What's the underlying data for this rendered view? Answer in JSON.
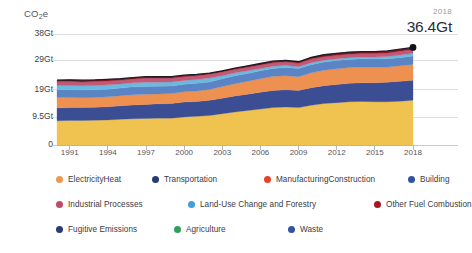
{
  "axis_unit_prefix": "CO",
  "axis_unit_sub": "2",
  "axis_unit_suffix": "e",
  "callout": {
    "year": "2018",
    "value": "36.4Gt"
  },
  "legend": {
    "rows": [
      [
        {
          "label": "ElectricityHeat",
          "color": "#eb9a52"
        },
        {
          "label": "Transportation",
          "color": "#2a3b74"
        },
        {
          "label": "ManufacturingConstruction",
          "color": "#e8402a"
        },
        {
          "label": "Building",
          "color": "#33539e"
        }
      ],
      [
        {
          "label": "Industrial Processes",
          "color": "#c04a6b"
        },
        {
          "label": "Land-Use Change and Forestry",
          "color": "#3f9fdc"
        },
        {
          "label": "Other Fuel Combustion",
          "color": "#a81622"
        }
      ],
      [
        {
          "label": "Fugitive Emissions",
          "color": "#2a3b74"
        },
        {
          "label": "Agriculture",
          "color": "#2e9e5b"
        },
        {
          "label": "Waste",
          "color": "#33539e"
        }
      ]
    ]
  },
  "chart_data": {
    "type": "area",
    "stacked": true,
    "title": "",
    "subtitle": "",
    "xlabel": "",
    "ylabel": "CO2e",
    "ylim": [
      0,
      38
    ],
    "yticks": [
      0,
      9.5,
      19,
      29,
      38
    ],
    "ytick_labels": [
      "0",
      "9.5Gt",
      "19Gt",
      "29Gt",
      "38Gt"
    ],
    "grid": true,
    "grid_axis": "y",
    "legend_position": "below",
    "xlim": [
      1990,
      2018
    ],
    "x": [
      1990,
      1991,
      1992,
      1993,
      1994,
      1995,
      1996,
      1997,
      1998,
      1999,
      2000,
      2001,
      2002,
      2003,
      2004,
      2005,
      2006,
      2007,
      2008,
      2009,
      2010,
      2011,
      2012,
      2013,
      2014,
      2015,
      2016,
      2017,
      2018
    ],
    "xticks": [
      1991,
      1994,
      1997,
      2000,
      2003,
      2006,
      2009,
      2012,
      2015,
      2018
    ],
    "xtick_labels": [
      "1991",
      "1994",
      "1997",
      "2000",
      "2003",
      "2006",
      "2009",
      "2012",
      "2015",
      "2018"
    ],
    "annotations": [
      {
        "x": 2018,
        "y": 36.4,
        "year_label": "2018",
        "value_label": "36.4Gt",
        "marker": "dot"
      }
    ],
    "total_values": [
      22.2,
      22.3,
      22.2,
      22.3,
      22.5,
      22.7,
      23.1,
      23.4,
      23.4,
      23.4,
      23.9,
      24.2,
      24.6,
      25.4,
      26.3,
      27.1,
      27.9,
      28.7,
      29.0,
      28.5,
      30.0,
      30.9,
      31.4,
      31.8,
      32.0,
      32.0,
      32.2,
      32.8,
      33.4
    ],
    "series": [
      {
        "name": "ElectricityHeat",
        "color": "#f0c350",
        "values": [
          8.3,
          8.4,
          8.4,
          8.5,
          8.6,
          8.8,
          9.0,
          9.1,
          9.2,
          9.2,
          9.6,
          9.8,
          10.1,
          10.7,
          11.3,
          11.8,
          12.3,
          12.8,
          13.0,
          12.8,
          13.6,
          14.2,
          14.5,
          14.8,
          14.9,
          14.8,
          14.8,
          15.0,
          15.3
        ]
      },
      {
        "name": "Transportation",
        "color": "#3b4e94",
        "values": [
          4.4,
          4.4,
          4.4,
          4.4,
          4.5,
          4.6,
          4.7,
          4.8,
          4.9,
          5.0,
          5.1,
          5.1,
          5.2,
          5.3,
          5.5,
          5.6,
          5.8,
          5.9,
          5.9,
          5.9,
          6.0,
          6.1,
          6.2,
          6.3,
          6.4,
          6.5,
          6.7,
          6.8,
          6.9
        ]
      },
      {
        "name": "ManufacturingConstruction",
        "color": "#ee9050",
        "values": [
          3.6,
          3.5,
          3.4,
          3.4,
          3.4,
          3.5,
          3.5,
          3.5,
          3.4,
          3.4,
          3.5,
          3.6,
          3.7,
          4.0,
          4.2,
          4.4,
          4.6,
          4.8,
          4.8,
          4.7,
          5.1,
          5.3,
          5.4,
          5.4,
          5.4,
          5.3,
          5.2,
          5.3,
          5.4
        ]
      },
      {
        "name": "Building",
        "color": "#5b84c4",
        "values": [
          2.6,
          2.6,
          2.6,
          2.6,
          2.6,
          2.6,
          2.7,
          2.6,
          2.6,
          2.6,
          2.6,
          2.6,
          2.6,
          2.7,
          2.7,
          2.7,
          2.7,
          2.7,
          2.8,
          2.8,
          2.8,
          2.8,
          2.8,
          2.8,
          2.8,
          2.8,
          2.8,
          2.8,
          2.9
        ]
      },
      {
        "name": "Land-Use Change and Forestry",
        "color": "#69b9e0",
        "values": [
          1.5,
          1.5,
          1.5,
          1.5,
          1.5,
          1.4,
          1.4,
          1.5,
          1.4,
          1.4,
          1.3,
          1.3,
          1.3,
          1.0,
          1.0,
          0.9,
          0.8,
          0.8,
          0.8,
          0.6,
          0.7,
          0.6,
          0.6,
          0.6,
          0.6,
          0.7,
          0.8,
          0.9,
          0.9
        ]
      },
      {
        "name": "Industrial Processes",
        "color": "#c15a77",
        "values": [
          1.3,
          1.3,
          1.3,
          1.3,
          1.3,
          1.3,
          1.3,
          1.4,
          1.4,
          1.3,
          1.3,
          1.3,
          1.3,
          1.3,
          1.2,
          1.2,
          1.2,
          1.2,
          1.2,
          1.2,
          1.2,
          1.2,
          1.2,
          1.2,
          1.2,
          1.2,
          1.2,
          1.3,
          1.3
        ]
      },
      {
        "name": "Other Fuel Combustion",
        "color": "#8e1420",
        "values": [
          0.5,
          0.6,
          0.6,
          0.6,
          0.6,
          0.5,
          0.5,
          0.5,
          0.5,
          0.5,
          0.5,
          0.5,
          0.4,
          0.4,
          0.4,
          0.5,
          0.5,
          0.5,
          0.5,
          0.5,
          0.6,
          0.7,
          0.7,
          0.7,
          0.7,
          0.7,
          0.7,
          0.7,
          0.7
        ]
      }
    ]
  }
}
